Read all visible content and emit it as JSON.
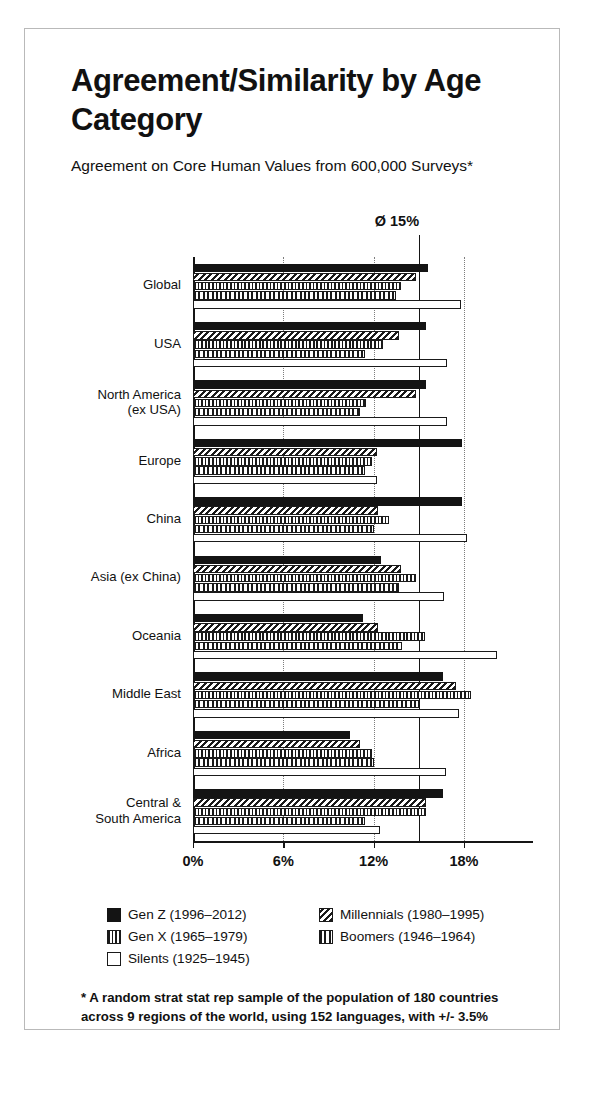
{
  "card": {
    "title": "Agreement/Similarity by Age Category",
    "subtitle": "Agreement on Core Human Values from 600,000 Surveys*",
    "footnote": "* A random strat stat rep sample of the population of 180 countries across 9 regions of the world, using 152 languages, with +/- 3.5% accuracy/95% confidence"
  },
  "chart_data": {
    "type": "bar",
    "orientation": "horizontal",
    "title": "Agreement/Similarity by Age Category",
    "subtitle": "Agreement on Core Human Values from 600,000 Surveys*",
    "xlabel": "",
    "ylabel": "",
    "xlim": [
      0,
      22.5
    ],
    "xunit": "%",
    "grid": "vertical dotted gridlines at 6%, 12%, 18%",
    "legend_position": "below-axis",
    "tick_labels": [
      "0%",
      "6%",
      "12%",
      "18%"
    ],
    "tick_values": [
      0,
      6,
      12,
      18
    ],
    "average_line": {
      "label": "Ø 15%",
      "value": 15
    },
    "categories": [
      "Global",
      "USA",
      "North America\n(ex USA)",
      "Europe",
      "China",
      "Asia (ex China)",
      "Oceania",
      "Middle East",
      "Africa",
      "Central &\nSouth America"
    ],
    "series": [
      {
        "name": "Gen Z (1996–2012)",
        "pattern": "solid-black",
        "values": [
          15.6,
          15.5,
          15.5,
          17.9,
          17.9,
          12.5,
          11.3,
          16.6,
          10.4,
          16.6
        ]
      },
      {
        "name": "Millennials (1980–1995)",
        "pattern": "diagonal-hatch",
        "values": [
          14.8,
          13.7,
          14.8,
          12.2,
          12.3,
          13.8,
          12.3,
          17.5,
          11.1,
          15.5
        ]
      },
      {
        "name": "Gen X (1965–1979)",
        "pattern": "grid-hatch",
        "values": [
          13.8,
          12.6,
          11.5,
          11.9,
          13.0,
          14.8,
          15.4,
          18.5,
          11.9,
          15.5
        ]
      },
      {
        "name": "Boomers (1946–1964)",
        "pattern": "vertical-lines",
        "values": [
          13.5,
          11.4,
          11.1,
          11.4,
          12.0,
          13.7,
          13.9,
          15.0,
          12.0,
          11.4
        ]
      },
      {
        "name": "Silents (1925–1945)",
        "pattern": "white-outline",
        "values": [
          17.8,
          16.9,
          16.9,
          12.2,
          18.2,
          16.7,
          20.2,
          17.7,
          16.8,
          12.4
        ]
      }
    ]
  }
}
